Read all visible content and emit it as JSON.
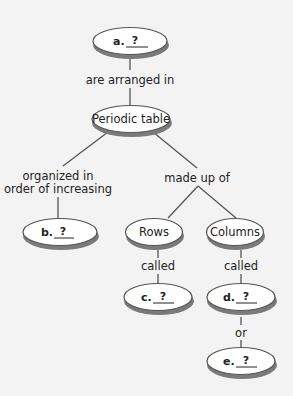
{
  "concept_map": {
    "nodes": {
      "a": {
        "prefix": "a.",
        "blank": "?"
      },
      "periodic_table": {
        "label": "Periodic table"
      },
      "b": {
        "prefix": "b.",
        "blank": "?"
      },
      "rows": {
        "label": "Rows"
      },
      "columns": {
        "label": "Columns"
      },
      "c": {
        "prefix": "c.",
        "blank": "?"
      },
      "d": {
        "prefix": "d.",
        "blank": "?"
      },
      "e": {
        "prefix": "e.",
        "blank": "?"
      }
    },
    "links": {
      "a_to_table": "are arranged in",
      "table_to_b_line1": "organized in",
      "table_to_b_line2": "order of increasing",
      "table_to_rowscols": "made up of",
      "rows_to_c": "called",
      "columns_to_d": "called",
      "d_to_e": "or"
    }
  },
  "colors": {
    "background": "#f3f3f3",
    "node_fill": "#ffffff",
    "node_stroke": "#555555",
    "shadow": "#7a7a7a",
    "line": "#555555",
    "text": "#222222"
  }
}
